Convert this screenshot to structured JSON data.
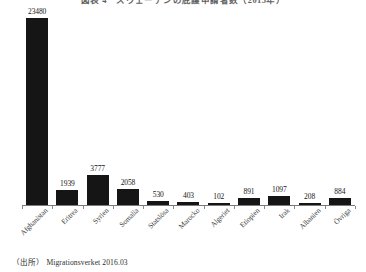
{
  "chart_data": {
    "type": "bar",
    "title": "図表 4　スウェーデンの庇護申請者数（2015年）",
    "xlabel": "",
    "ylabel": "",
    "ylim": [
      0,
      24500
    ],
    "grid": false,
    "legend": "none",
    "categories": [
      "Afghanistan",
      "Eritrea",
      "Syrien",
      "Somalia",
      "Statslösa",
      "Marocko",
      "Algeriet",
      "Etiopien",
      "Irak",
      "Albanien",
      "Övriga"
    ],
    "values": [
      23480,
      1939,
      3777,
      2058,
      530,
      403,
      102,
      891,
      1097,
      208,
      884
    ],
    "data_labels": [
      "23480",
      "1939",
      "3777",
      "2058",
      "530",
      "403",
      "102",
      "891",
      "1097",
      "208",
      "884"
    ],
    "bar_color": "#151515",
    "axis_color": "#7a7a7a"
  },
  "source": {
    "label": "（出所）",
    "text": "Migrationsverket 2016.03"
  }
}
